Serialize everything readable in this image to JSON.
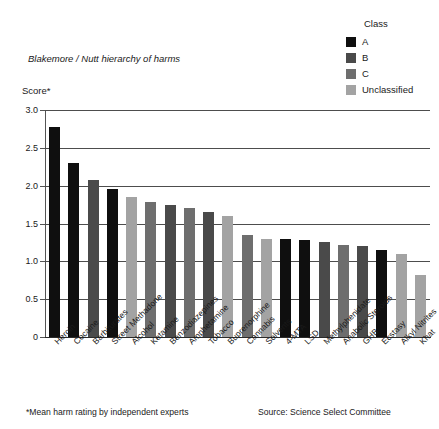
{
  "chart_data": {
    "type": "bar",
    "title": "Blakemore / Nutt hierarchy of harms",
    "ylabel": "Score*",
    "xlabel": "",
    "ylim": [
      0,
      3.0
    ],
    "ytick_values": [
      "0",
      "0.5",
      "1.0",
      "1.5",
      "2.0",
      "2.5",
      "3.0"
    ],
    "grid": true,
    "legend_position": "top-right",
    "categories": [
      "Heroin",
      "Cocaine",
      "Barbiturates",
      "Street Methadone",
      "Alcohol",
      "Ketamine",
      "Benzodiazepines",
      "Amphetamine",
      "Tobacco",
      "Buprenorphine",
      "Cannabis",
      "Solvents",
      "4-MTA",
      "LSD",
      "Methylphenidate",
      "Anabolic Steroids",
      "GHB",
      "Ecstasy",
      "Alkyl Nitrites",
      "Khat"
    ],
    "values": [
      2.78,
      2.3,
      2.08,
      1.95,
      1.85,
      1.78,
      1.75,
      1.7,
      1.65,
      1.6,
      1.35,
      1.3,
      1.3,
      1.28,
      1.25,
      1.22,
      1.2,
      1.15,
      1.1,
      0.82
    ],
    "classes": [
      "A",
      "A",
      "B",
      "A",
      "Unclassified",
      "C",
      "B",
      "C",
      "B",
      "Unclassified",
      "C",
      "Unclassified",
      "A",
      "A",
      "B",
      "C",
      "B",
      "A",
      "Unclassified",
      "Unclassified"
    ]
  },
  "legend": {
    "title": "Class",
    "items": [
      {
        "label": "A",
        "color": "#0f0f0f"
      },
      {
        "label": "B",
        "color": "#4a4a4a"
      },
      {
        "label": "C",
        "color": "#6e6e6e"
      },
      {
        "label": "Unclassified",
        "color": "#a3a3a3"
      }
    ]
  },
  "footnotes": {
    "left": "*Mean harm rating by independent experts",
    "right": "Source: Science Select Committee"
  }
}
